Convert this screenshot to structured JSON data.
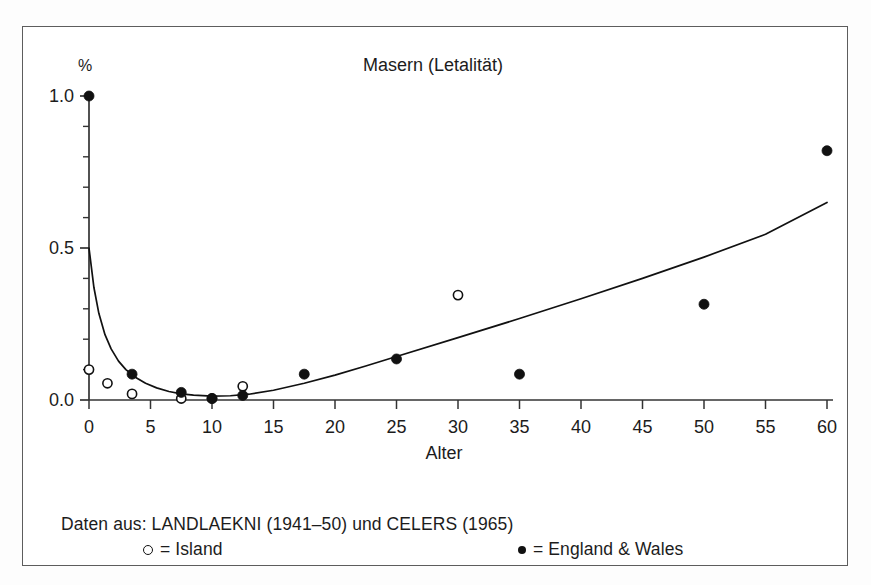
{
  "figure": {
    "title": "Masern (Letalität)",
    "xlabel": "Alter",
    "ylabel_unit": "%",
    "caption_source": "Daten aus: LANDLAEKNI (1941–50) und CELERS (1965)",
    "legend": {
      "island_label": "= Island",
      "england_label": "= England & Wales"
    }
  },
  "chart_data": {
    "type": "scatter",
    "title": "Masern (Letalität)",
    "xlabel": "Alter",
    "ylabel": "%",
    "xlim": [
      0,
      60
    ],
    "ylim": [
      0.0,
      1.0
    ],
    "xticks": [
      0,
      5,
      10,
      15,
      20,
      25,
      30,
      35,
      40,
      45,
      50,
      55,
      60
    ],
    "xtick_labels": [
      "0",
      "5",
      "10",
      "15",
      "20",
      "25",
      "30",
      "35",
      "40",
      "45",
      "50",
      "55",
      "60"
    ],
    "yticks": [
      0.0,
      0.5,
      1.0
    ],
    "ytick_labels": [
      "0.0",
      "0.5",
      "1.0"
    ],
    "yminorticks": [
      0.1,
      0.2,
      0.3,
      0.4,
      0.6,
      0.7,
      0.8,
      0.9
    ],
    "grid": false,
    "legend_position": "below-axes",
    "series": [
      {
        "name": "Island",
        "marker": "open-circle",
        "color": "#111111",
        "points": [
          {
            "x": 0.0,
            "y": 0.1
          },
          {
            "x": 1.5,
            "y": 0.055
          },
          {
            "x": 3.5,
            "y": 0.02
          },
          {
            "x": 7.5,
            "y": 0.005
          },
          {
            "x": 10.0,
            "y": 0.005
          },
          {
            "x": 12.5,
            "y": 0.045
          },
          {
            "x": 30.0,
            "y": 0.345
          }
        ]
      },
      {
        "name": "England & Wales",
        "marker": "filled-circle",
        "color": "#111111",
        "points": [
          {
            "x": 0.0,
            "y": 1.0
          },
          {
            "x": 3.5,
            "y": 0.085
          },
          {
            "x": 7.5,
            "y": 0.025
          },
          {
            "x": 10.0,
            "y": 0.005
          },
          {
            "x": 12.5,
            "y": 0.015
          },
          {
            "x": 17.5,
            "y": 0.085
          },
          {
            "x": 25.0,
            "y": 0.135
          },
          {
            "x": 35.0,
            "y": 0.085
          },
          {
            "x": 50.0,
            "y": 0.315
          },
          {
            "x": 60.0,
            "y": 0.82
          }
        ]
      }
    ],
    "fit_curve": {
      "name": "fitted letality curve",
      "points": [
        {
          "x": 0.0,
          "y": 0.5
        },
        {
          "x": 0.4,
          "y": 0.37
        },
        {
          "x": 0.8,
          "y": 0.285
        },
        {
          "x": 1.3,
          "y": 0.215
        },
        {
          "x": 1.8,
          "y": 0.168
        },
        {
          "x": 2.4,
          "y": 0.128
        },
        {
          "x": 3.0,
          "y": 0.1
        },
        {
          "x": 3.8,
          "y": 0.074
        },
        {
          "x": 4.6,
          "y": 0.055
        },
        {
          "x": 5.5,
          "y": 0.04
        },
        {
          "x": 6.5,
          "y": 0.028
        },
        {
          "x": 7.5,
          "y": 0.02
        },
        {
          "x": 8.5,
          "y": 0.016
        },
        {
          "x": 10.0,
          "y": 0.013
        },
        {
          "x": 11.5,
          "y": 0.014
        },
        {
          "x": 13.0,
          "y": 0.019
        },
        {
          "x": 15.0,
          "y": 0.032
        },
        {
          "x": 17.5,
          "y": 0.055
        },
        {
          "x": 20.0,
          "y": 0.082
        },
        {
          "x": 22.5,
          "y": 0.112
        },
        {
          "x": 25.0,
          "y": 0.143
        },
        {
          "x": 30.0,
          "y": 0.205
        },
        {
          "x": 35.0,
          "y": 0.268
        },
        {
          "x": 40.0,
          "y": 0.333
        },
        {
          "x": 45.0,
          "y": 0.4
        },
        {
          "x": 50.0,
          "y": 0.47
        },
        {
          "x": 55.0,
          "y": 0.545
        },
        {
          "x": 60.0,
          "y": 0.65
        }
      ]
    }
  }
}
